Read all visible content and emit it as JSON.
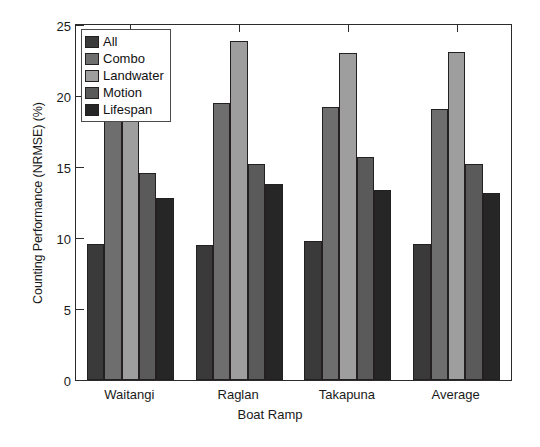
{
  "chart_data": {
    "type": "bar",
    "title": "",
    "xlabel": "Boat Ramp",
    "ylabel": "Counting Performance (NRMSE) (%)",
    "categories": [
      "Waitangi",
      "Raglan",
      "Takapuna",
      "Average"
    ],
    "series": [
      {
        "name": "All",
        "values": [
          9.6,
          9.5,
          9.8,
          9.6
        ],
        "color": "#3a3a3a"
      },
      {
        "name": "Combo",
        "values": [
          18.6,
          19.5,
          19.2,
          19.1
        ],
        "color": "#6e6e6e"
      },
      {
        "name": "Landwater",
        "values": [
          22.4,
          23.9,
          23.0,
          23.1
        ],
        "color": "#9e9e9e"
      },
      {
        "name": "Motion",
        "values": [
          14.6,
          15.2,
          15.7,
          15.2
        ],
        "color": "#5a5a5a"
      },
      {
        "name": "Lifespan",
        "values": [
          12.8,
          13.8,
          13.4,
          13.2
        ],
        "color": "#262626"
      }
    ],
    "ylim": [
      0,
      25
    ],
    "yticks": [
      0,
      5,
      10,
      15,
      20,
      25
    ],
    "ytick_labels": [
      "0",
      "5",
      "10",
      "15",
      "20",
      "25"
    ],
    "grid": false,
    "legend_position": "upper left",
    "axis_color": "#2b2b2b",
    "background": "#ffffff"
  }
}
